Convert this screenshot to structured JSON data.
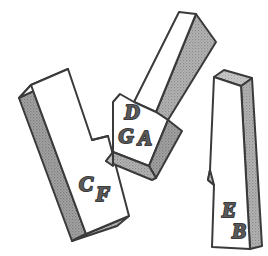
{
  "figure": {
    "background_color": "#ffffff",
    "outline_color": "#3a3a3a",
    "face_white_color": "#ffffff",
    "face_gray_color": "#a8a8a8",
    "face_gray_dark_color": "#949494",
    "face_gray_light_color": "#c2c2c2",
    "label_color": "#5a5a5a",
    "piece_count": 3
  },
  "pieces": [
    {
      "id": "piece-left",
      "name": "left-notched-bar",
      "description": "Tall bar tilted clockwise with a step notch on its right edge near the lower third",
      "labels": [
        {
          "text": "C",
          "x": 86,
          "y": 191,
          "size": 21
        },
        {
          "text": "F",
          "x": 103,
          "y": 201,
          "size": 21
        }
      ]
    },
    {
      "id": "piece-middle",
      "name": "middle-diagonal-bar",
      "description": "Long bar oriented diagonally from upper-right to lower-left with a notched shoulder and a V shaped foot",
      "labels": [
        {
          "text": "D",
          "x": 132,
          "y": 119,
          "size": 21
        },
        {
          "text": "G",
          "x": 126,
          "y": 141,
          "size": 21
        },
        {
          "text": "A",
          "x": 144,
          "y": 143,
          "size": 21
        }
      ]
    },
    {
      "id": "piece-right",
      "name": "right-vertical-bar",
      "description": "Narrow near-vertical bar with a small triangular notch on its left edge and a shaded top face",
      "labels": [
        {
          "text": "E",
          "x": 228,
          "y": 216,
          "size": 21
        },
        {
          "text": "B",
          "x": 238,
          "y": 236,
          "size": 21
        }
      ]
    }
  ],
  "all_labels": [
    "C",
    "F",
    "D",
    "G",
    "A",
    "E",
    "B"
  ]
}
